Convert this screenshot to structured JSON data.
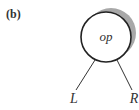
{
  "figure": {
    "panel_label": "(b)",
    "node": {
      "label": "op",
      "shadow_color": "#a8a8a8",
      "stroke_color": "#222222"
    },
    "children": [
      {
        "label": "L"
      },
      {
        "label": "R"
      }
    ]
  }
}
